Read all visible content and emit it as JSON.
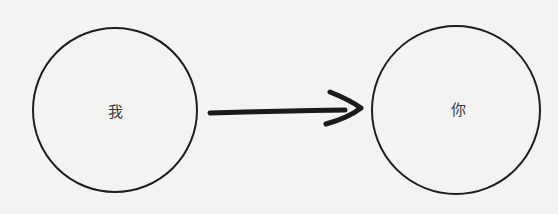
{
  "diagram": {
    "nodes": [
      {
        "id": "me",
        "label": "我",
        "cx": 115,
        "cy": 110,
        "r": 82
      },
      {
        "id": "you",
        "label": "你",
        "cx": 456,
        "cy": 110,
        "r": 84
      }
    ],
    "edges": [
      {
        "from": "me",
        "to": "you",
        "style": "hand-drawn arrow"
      }
    ],
    "colors": {
      "background": "#f3f3f2",
      "stroke": "#1e1e1e",
      "text": "#3a3a3a"
    }
  }
}
